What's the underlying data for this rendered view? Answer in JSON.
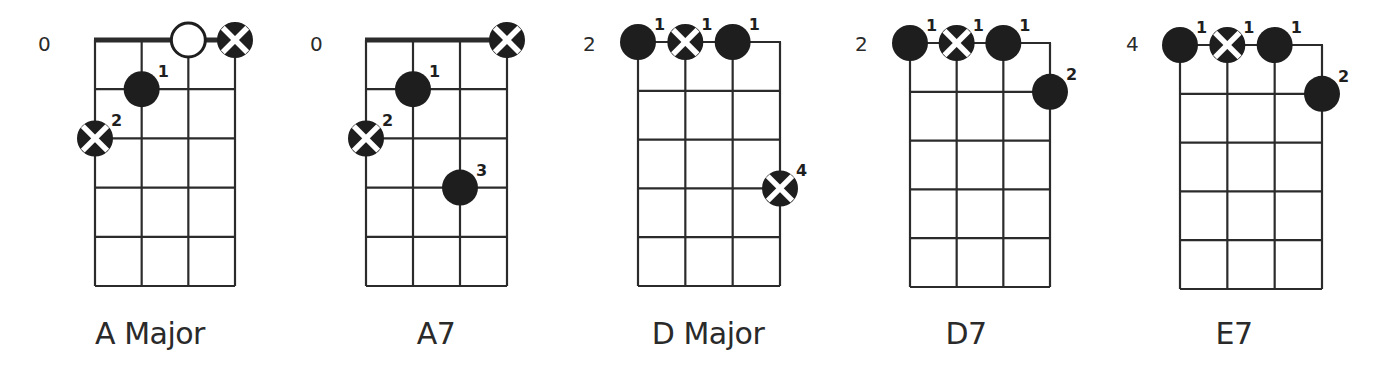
{
  "colors": {
    "ink": "#1e1e1e",
    "grid": "#2b2b2b",
    "background": "#ffffff"
  },
  "legend": {
    "filled-dot": "finger placement",
    "cross-dot": "finger placement (alternate marker)",
    "open-circle": "open string"
  },
  "chords": [
    {
      "name": "A Major",
      "fret_label": "0",
      "nut": true,
      "grid": {
        "left": 95,
        "right": 235,
        "top": 40,
        "bottom": 286
      },
      "label_pos": {
        "x": 150,
        "y": 316
      },
      "fret_label_pos": {
        "x": 38,
        "y": 32
      },
      "open_strings": [
        {
          "string": 3,
          "marker": "open"
        },
        {
          "string": 4,
          "marker": "cross"
        }
      ],
      "dots": [
        {
          "string": 2,
          "fret": 1,
          "finger": "1",
          "marker": "filled"
        },
        {
          "string": 1,
          "fret": 2,
          "finger": "2",
          "marker": "cross"
        }
      ]
    },
    {
      "name": "A7",
      "fret_label": "0",
      "nut": true,
      "grid": {
        "left": 366,
        "right": 507,
        "top": 40,
        "bottom": 286
      },
      "label_pos": {
        "x": 436,
        "y": 316
      },
      "fret_label_pos": {
        "x": 310,
        "y": 32
      },
      "open_strings": [
        {
          "string": 4,
          "marker": "cross"
        }
      ],
      "dots": [
        {
          "string": 2,
          "fret": 1,
          "finger": "1",
          "marker": "filled"
        },
        {
          "string": 1,
          "fret": 2,
          "finger": "2",
          "marker": "cross"
        },
        {
          "string": 3,
          "fret": 3,
          "finger": "3",
          "marker": "filled"
        }
      ]
    },
    {
      "name": "D Major",
      "fret_label": "2",
      "nut": false,
      "grid": {
        "left": 638,
        "right": 780,
        "top": 42,
        "bottom": 286
      },
      "label_pos": {
        "x": 708,
        "y": 316
      },
      "fret_label_pos": {
        "x": 583,
        "y": 32
      },
      "open_strings": [],
      "dots": [
        {
          "string": 1,
          "fret": 0,
          "finger": "1",
          "marker": "filled"
        },
        {
          "string": 2,
          "fret": 0,
          "finger": "1",
          "marker": "cross"
        },
        {
          "string": 3,
          "fret": 0,
          "finger": "1",
          "marker": "filled"
        },
        {
          "string": 4,
          "fret": 3,
          "finger": "4",
          "marker": "cross"
        }
      ]
    },
    {
      "name": "D7",
      "fret_label": "2",
      "nut": false,
      "grid": {
        "left": 910,
        "right": 1050,
        "top": 43,
        "bottom": 287
      },
      "label_pos": {
        "x": 966,
        "y": 316
      },
      "fret_label_pos": {
        "x": 855,
        "y": 32
      },
      "open_strings": [],
      "dots": [
        {
          "string": 1,
          "fret": 0,
          "finger": "1",
          "marker": "filled"
        },
        {
          "string": 2,
          "fret": 0,
          "finger": "1",
          "marker": "cross"
        },
        {
          "string": 3,
          "fret": 0,
          "finger": "1",
          "marker": "filled"
        },
        {
          "string": 4,
          "fret": 1,
          "finger": "2",
          "marker": "filled"
        }
      ]
    },
    {
      "name": "E7",
      "fret_label": "4",
      "nut": false,
      "grid": {
        "left": 1180,
        "right": 1322,
        "top": 45,
        "bottom": 289
      },
      "label_pos": {
        "x": 1234,
        "y": 316
      },
      "fret_label_pos": {
        "x": 1126,
        "y": 32
      },
      "open_strings": [],
      "dots": [
        {
          "string": 1,
          "fret": 0,
          "finger": "1",
          "marker": "filled"
        },
        {
          "string": 2,
          "fret": 0,
          "finger": "1",
          "marker": "cross"
        },
        {
          "string": 3,
          "fret": 0,
          "finger": "1",
          "marker": "filled"
        },
        {
          "string": 4,
          "fret": 1,
          "finger": "2",
          "marker": "filled"
        }
      ]
    }
  ]
}
